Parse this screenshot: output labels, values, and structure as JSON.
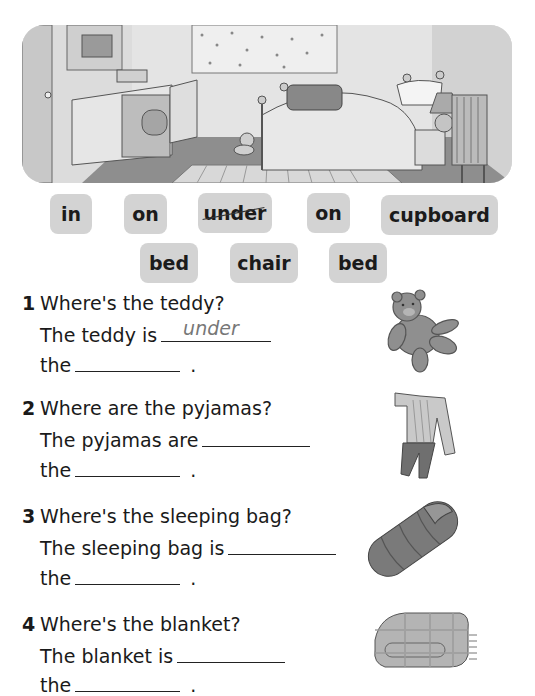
{
  "scene": {
    "description": "bedroom illustration with cupboard, bed, teddy, pyjamas on chair, sleeping bag, blanket"
  },
  "word_bank": {
    "row1": [
      {
        "label": "in",
        "crossed": false
      },
      {
        "label": "on",
        "crossed": false
      },
      {
        "label": "under",
        "crossed": true
      },
      {
        "label": "on",
        "crossed": false
      },
      {
        "label": "cupboard",
        "crossed": false
      }
    ],
    "row2": [
      {
        "label": "bed",
        "crossed": false
      },
      {
        "label": "chair",
        "crossed": false
      },
      {
        "label": "bed",
        "crossed": false
      }
    ]
  },
  "questions": [
    {
      "number": "1",
      "question": "Where's the teddy?",
      "line1": "The teddy is",
      "answer1": "under",
      "line2": "the",
      "answer2": "",
      "end": ".",
      "image": "teddy-bear"
    },
    {
      "number": "2",
      "question": "Where are the pyjamas?",
      "line1": "The pyjamas are",
      "answer1": "",
      "line2": "the",
      "answer2": "",
      "end": ".",
      "image": "pyjamas"
    },
    {
      "number": "3",
      "question": "Where's the sleeping bag?",
      "line1": "The sleeping bag is",
      "answer1": "",
      "line2": "the",
      "answer2": "",
      "end": ".",
      "image": "sleeping-bag"
    },
    {
      "number": "4",
      "question": "Where's the blanket?",
      "line1": "The blanket is",
      "answer1": "",
      "line2": "the",
      "answer2": "",
      "end": ".",
      "image": "blanket"
    }
  ]
}
